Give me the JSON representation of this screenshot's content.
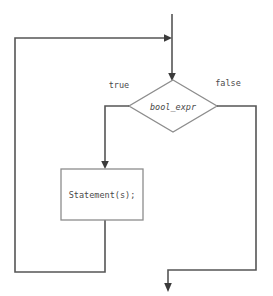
{
  "diagram": {
    "type": "flowchart",
    "topic": "while-loop control flow",
    "background_color": "#ffffff",
    "line_color": "#555555",
    "shape_stroke_color": "#8d8d8d",
    "text_color": "#4a4a4a",
    "nodes": [
      {
        "id": "condition",
        "shape": "diamond",
        "label": "bool_expr",
        "style": "italic",
        "cx": 173,
        "cy": 106,
        "half_width": 44,
        "half_height": 26
      },
      {
        "id": "body",
        "shape": "rectangle",
        "label": "Statement(s);",
        "style": "normal",
        "x": 61,
        "y": 169,
        "width": 82,
        "height": 51
      }
    ],
    "edges": [
      {
        "id": "entry",
        "from": "start",
        "to": "condition",
        "label": "",
        "has_arrowhead": true
      },
      {
        "id": "true-branch",
        "from": "condition",
        "to": "body",
        "label": "true",
        "label_x": 119,
        "label_y": 85,
        "has_arrowhead": true
      },
      {
        "id": "false-branch",
        "from": "condition",
        "to": "exit",
        "label": "false",
        "label_x": 228,
        "label_y": 83,
        "has_arrowhead": true
      },
      {
        "id": "loop-back",
        "from": "body",
        "to": "entry",
        "label": "",
        "has_arrowhead": true
      }
    ]
  }
}
